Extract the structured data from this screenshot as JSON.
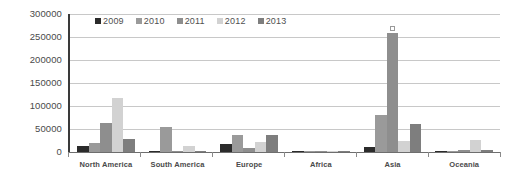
{
  "chart_data": {
    "type": "bar",
    "title": "",
    "xlabel": "",
    "ylabel": "",
    "categories": [
      "North America",
      "South America",
      "Europe",
      "Africa",
      "Asia",
      "Oceania"
    ],
    "series": [
      {
        "name": "2009",
        "color": "#2b2b2b",
        "values": [
          13000,
          1500,
          18000,
          900,
          11000,
          1200
        ]
      },
      {
        "name": "2010",
        "color": "#9a9a9a",
        "values": [
          20000,
          55000,
          38000,
          1800,
          80000,
          3000
        ]
      },
      {
        "name": "2011",
        "color": "#8e8e8e",
        "values": [
          62000,
          3000,
          8000,
          2200,
          258000,
          5000
        ]
      },
      {
        "name": "2012",
        "color": "#d2d2d2",
        "values": [
          118000,
          12000,
          22000,
          1200,
          25000,
          26000
        ]
      },
      {
        "name": "2013",
        "color": "#7e7e7e",
        "values": [
          28000,
          2000,
          38000,
          1500,
          60000,
          4000
        ]
      }
    ],
    "ylim": [
      0,
      300000
    ],
    "yticks": [
      0,
      50000,
      100000,
      150000,
      200000,
      250000,
      300000
    ],
    "ytick_labels": [
      "0",
      "50000",
      "100000",
      "150000",
      "200000",
      "250000",
      "300000"
    ],
    "grid": true,
    "legend_position": "top-left-inside",
    "annotations": [
      {
        "name": "asia-2011-peak-marker",
        "series": "2011",
        "category": "Asia",
        "value": 258000,
        "shape": "open-square"
      }
    ]
  },
  "legend": {
    "items": [
      {
        "label": "2009",
        "color": "#2b2b2b"
      },
      {
        "label": "2010",
        "color": "#9a9a9a"
      },
      {
        "label": "2011",
        "color": "#8e8e8e"
      },
      {
        "label": "2012",
        "color": "#d2d2d2"
      },
      {
        "label": "2013",
        "color": "#7e7e7e"
      }
    ]
  }
}
